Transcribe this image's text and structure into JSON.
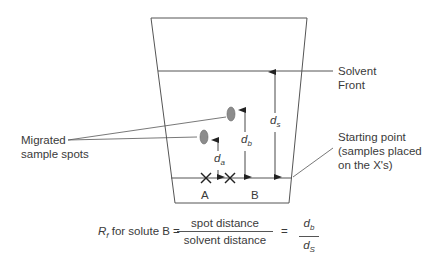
{
  "labels": {
    "solvent_front": [
      "Solvent",
      "Front"
    ],
    "migrated_spots": [
      "Migrated",
      "sample spots"
    ],
    "starting_point": [
      "Starting point",
      "(samples placed",
      "on the X's)"
    ],
    "lane_a": "A",
    "lane_b": "B"
  },
  "distances": {
    "da": {
      "main": "d",
      "sub": "a"
    },
    "db": {
      "main": "d",
      "sub": "b"
    },
    "ds": {
      "main": "d",
      "sub": "s"
    }
  },
  "formula": {
    "lhs_symbol": "R",
    "lhs_sub": "f",
    "lhs_text": " for solute B =",
    "numerator": "spot distance",
    "denominator": "solvent distance",
    "equals": "=",
    "rhs_num": {
      "main": "d",
      "sub": "b"
    },
    "rhs_den": {
      "main": "d",
      "sub": "S"
    }
  },
  "colors": {
    "line": "#555555",
    "spot": "#8c8c8c"
  }
}
